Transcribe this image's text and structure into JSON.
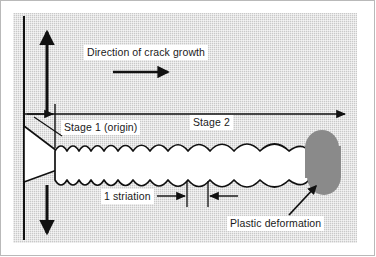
{
  "figure": {
    "panel": {
      "background_color": "#c9c9c9",
      "frame_color": "#b9b9b9"
    },
    "ink_color": "#111111",
    "crack_fill_color": "#ffffff",
    "plastic_zone_color": "#8a8a8a"
  },
  "labels": {
    "direction": "Direction of crack growth",
    "stage1": "Stage 1 (origin)",
    "stage2": "Stage 2",
    "striation": "1 striation",
    "plastic": "Plastic deformation"
  },
  "annotations": {
    "load_arrow_up": "tensile-load-up-arrow",
    "load_arrow_down": "tensile-load-down-arrow",
    "growth_arrow": "crack-growth-direction-arrow",
    "axis_arrow": "crack-propagation-axis-arrow",
    "origin_tick": "origin-tick-line",
    "leader_stage1": "stage-1-leader-line",
    "leader_plastic": "plastic-deformation-leader-arrow",
    "dimension_left": "striation-dimension-arrow-left",
    "dimension_right": "striation-dimension-arrow-right",
    "tick_left": "striation-tick-left",
    "tick_right": "striation-tick-right",
    "crack_band": "striated-crack-band",
    "notch_wedge": "initial-notch-wedge",
    "plastic_zone": "plastic-deformation-zone",
    "specimen_edge": "specimen-left-edge"
  }
}
